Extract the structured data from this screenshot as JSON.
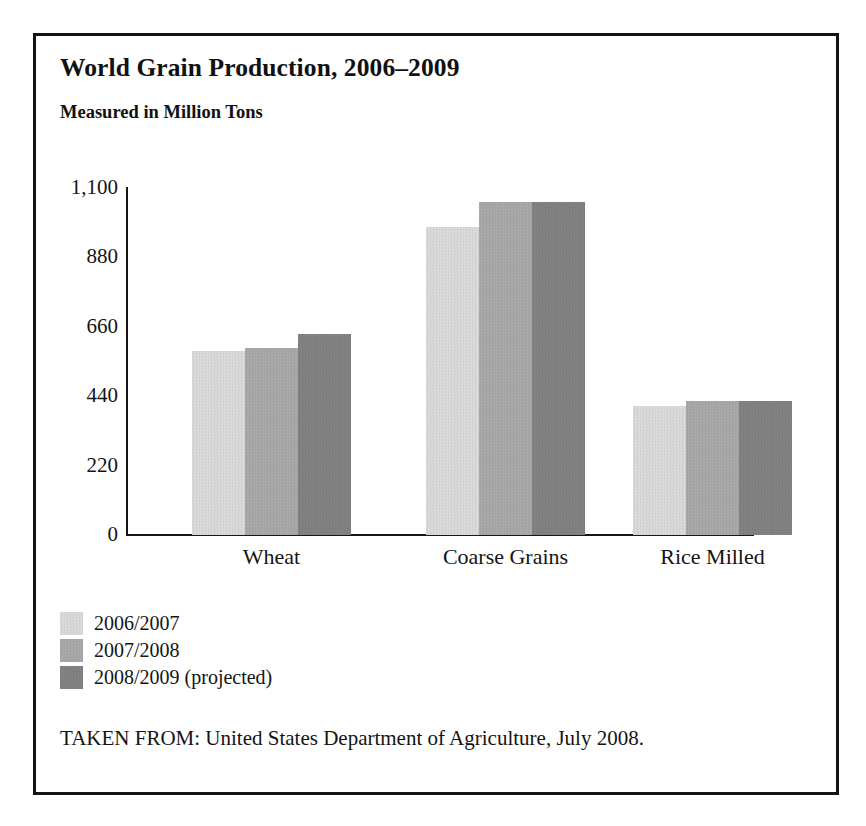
{
  "figure": {
    "title": "World Grain Production, 2006–2009",
    "subtitle": "Measured in Million Tons",
    "source_note": "TAKEN FROM: United States Department of Agriculture, July 2008."
  },
  "chart_data": {
    "type": "bar",
    "title": "World Grain Production, 2006–2009",
    "subtitle": "Measured in Million Tons",
    "xlabel": "",
    "ylabel": "Measured in Million Tons",
    "categories": [
      "Wheat",
      "Coarse Grains",
      "Rice Milled"
    ],
    "series": [
      {
        "name": "2006/2007",
        "color": "#dddddd",
        "values": [
          582,
          976,
          410
        ]
      },
      {
        "name": "2007/2008",
        "color": "#ababab",
        "values": [
          594,
          1056,
          426
        ]
      },
      {
        "name": "2008/2009 (projected)",
        "color": "#848484",
        "values": [
          636,
          1056,
          426
        ]
      }
    ],
    "ylim": [
      0,
      1100
    ],
    "yticks": [
      0,
      220,
      440,
      660,
      880,
      1100
    ],
    "ytick_labels": [
      "0",
      "220",
      "440",
      "660",
      "880",
      "1,100"
    ],
    "grid": false,
    "legend_position": "below-left",
    "bar_texture": "halftone-dither"
  },
  "axis": {
    "ticks": [
      {
        "label": "1,100",
        "value": 1100
      },
      {
        "label": "880",
        "value": 880
      },
      {
        "label": "660",
        "value": 660
      },
      {
        "label": "440",
        "value": 440
      },
      {
        "label": "220",
        "value": 220
      },
      {
        "label": "0",
        "value": 0
      }
    ]
  }
}
